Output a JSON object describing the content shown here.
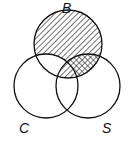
{
  "diagram": {
    "type": "venn",
    "sets": [
      {
        "id": "B",
        "label": "B",
        "cx": 68,
        "cy": 44,
        "r": 34
      },
      {
        "id": "C",
        "label": "C",
        "cx": 46,
        "cy": 86,
        "r": 32
      },
      {
        "id": "S",
        "label": "S",
        "cx": 88,
        "cy": 86,
        "r": 32
      }
    ],
    "shaded_regions": [
      {
        "region": "B only",
        "pattern": "diagonal-hatch"
      },
      {
        "region": "B and S only",
        "pattern": "crosshatch"
      },
      {
        "region": "B and C and S",
        "pattern": "diagonal-hatch"
      }
    ],
    "unshaded_regions": [
      "B and C only",
      "C only",
      "S only",
      "C and S only"
    ],
    "colors": {
      "stroke": "#111111",
      "background": "#ffffff"
    }
  }
}
